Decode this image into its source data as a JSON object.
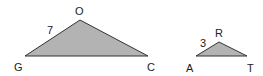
{
  "diagram": {
    "fill_color": "#b3b3b3",
    "stroke_color": "#333333",
    "triangles": [
      {
        "name": "GOC",
        "vertices": [
          {
            "label": "G",
            "x": 25,
            "y": 56
          },
          {
            "label": "O",
            "x": 80,
            "y": 20
          },
          {
            "label": "C",
            "x": 148,
            "y": 56
          }
        ],
        "side_label": {
          "side": "GO",
          "value": "7"
        }
      },
      {
        "name": "ART",
        "vertices": [
          {
            "label": "A",
            "x": 196,
            "y": 56
          },
          {
            "label": "R",
            "x": 219,
            "y": 42
          },
          {
            "label": "T",
            "x": 247,
            "y": 56
          }
        ],
        "side_label": {
          "side": "AR",
          "value": "3"
        }
      }
    ]
  }
}
